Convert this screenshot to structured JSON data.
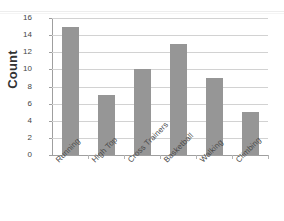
{
  "chart_data": {
    "type": "bar",
    "title": "",
    "subtitle": "",
    "xlabel": "",
    "ylabel": "Count",
    "categories": [
      "Running",
      "High Top",
      "Cross Trainers",
      "Basketball",
      "Walking",
      "Climbing"
    ],
    "values": [
      15,
      7,
      10,
      13,
      9,
      5
    ],
    "series": [
      {
        "name": "Count",
        "values": [
          15,
          7,
          10,
          13,
          9,
          5
        ]
      }
    ],
    "ylim": [
      0,
      16
    ],
    "ytick_step": 2,
    "yticks": [
      16,
      14,
      12,
      10,
      8,
      6,
      4,
      2,
      0
    ],
    "ytick_labels": [
      "16",
      "14",
      "12",
      "10",
      "8",
      "6",
      "4",
      "2",
      "0"
    ],
    "grid": true,
    "grid_axis": "y",
    "legend": false,
    "legend_position": "none",
    "bar_color": "#969696",
    "gridline_color": "#d2d2d2",
    "axis_color": "#9f9f9f",
    "xtick_label_rotation": -45,
    "annotations": []
  }
}
